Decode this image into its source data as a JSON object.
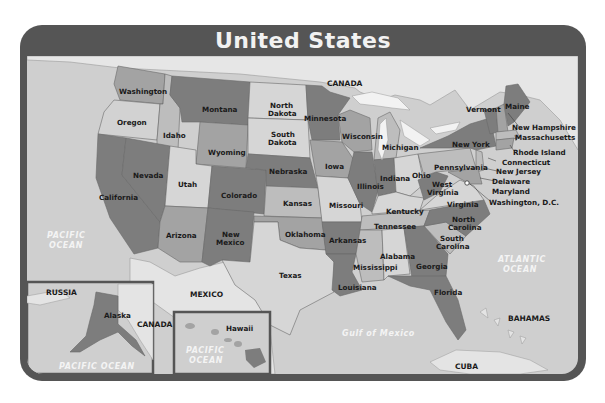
{
  "title": "United States",
  "colors": {
    "frame": "#555555",
    "ocean": "#cfcfcf",
    "foreign_land": "#e4e4e4",
    "state_dark": "#7d7d7d",
    "state_mid": "#a3a3a3",
    "state_light": "#bdbdbd",
    "state_pale": "#d6d6d6",
    "ocean_label": "#f4f4f4"
  },
  "states": {
    "washington": "Washington",
    "oregon": "Oregon",
    "california": "California",
    "idaho": "Idaho",
    "nevada": "Nevada",
    "montana": "Montana",
    "wyoming": "Wyoming",
    "utah": "Utah",
    "arizona": "Arizona",
    "colorado": "Colorado",
    "new_mexico_1": "New",
    "new_mexico_2": "Mexico",
    "north_dakota_1": "North",
    "north_dakota_2": "Dakota",
    "south_dakota_1": "South",
    "south_dakota_2": "Dakota",
    "nebraska": "Nebraska",
    "kansas": "Kansas",
    "oklahoma": "Oklahoma",
    "texas": "Texas",
    "minnesota": "Minnesota",
    "iowa": "Iowa",
    "missouri": "Missouri",
    "arkansas": "Arkansas",
    "louisiana": "Louisiana",
    "wisconsin": "Wisconsin",
    "illinois": "Illinois",
    "michigan": "Michigan",
    "indiana": "Indiana",
    "ohio": "Ohio",
    "kentucky": "Kentucky",
    "tennessee": "Tennessee",
    "mississippi": "Mississippi",
    "alabama": "Alabama",
    "georgia": "Georgia",
    "florida": "Florida",
    "south_carolina_1": "South",
    "south_carolina_2": "Carolina",
    "north_carolina_1": "North",
    "north_carolina_2": "Carolina",
    "virginia": "Virginia",
    "west_virginia_1": "West",
    "west_virginia_2": "Virginia",
    "pennsylvania": "Pennsylvania",
    "new_york": "New York",
    "vermont": "Vermont",
    "maine": "Maine",
    "new_hampshire": "New Hampshire",
    "massachusetts": "Massachusetts",
    "rhode_island": "Rhode Island",
    "connecticut": "Connecticut",
    "new_jersey": "New Jersey",
    "delaware": "Delaware",
    "maryland": "Maryland",
    "washington_dc": "Washington, D.C.",
    "alaska": "Alaska",
    "hawaii": "Hawaii"
  },
  "countries": {
    "canada": "CANADA",
    "mexico": "MEXICO",
    "russia": "RUSSIA",
    "canada_inset": "CANADA",
    "bahamas": "BAHAMAS",
    "cuba": "CUBA"
  },
  "water": {
    "pacific_1": "PACIFIC",
    "pacific_2": "OCEAN",
    "atlantic_1": "ATLANTIC",
    "atlantic_2": "OCEAN",
    "gulf": "Gulf of Mexico",
    "pacific_alaska": "PACIFIC OCEAN",
    "pacific_hawaii_1": "PACIFIC",
    "pacific_hawaii_2": "OCEAN"
  }
}
